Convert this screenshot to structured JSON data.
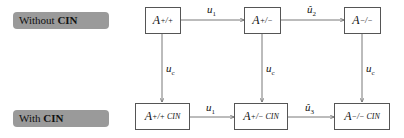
{
  "rows": [
    {
      "label_prefix": "Without ",
      "label_bold": "CIN"
    },
    {
      "label_prefix": "With ",
      "label_bold": "CIN"
    }
  ],
  "top_nodes": [
    {
      "base": "A",
      "sup": "+/+"
    },
    {
      "base": "A",
      "sup": "+/−"
    },
    {
      "base": "A",
      "sup": "−/−"
    }
  ],
  "bottom_nodes": [
    {
      "base": "A",
      "sup": "+/+ CIN"
    },
    {
      "base": "A",
      "sup": "+/− CIN"
    },
    {
      "base": "A",
      "sup": "−/− CIN"
    }
  ],
  "top_edges": [
    {
      "base": "u",
      "sub": "1"
    },
    {
      "base": "û",
      "sub": "2"
    }
  ],
  "bottom_edges": [
    {
      "base": "u",
      "sub": "1"
    },
    {
      "base": "û",
      "sub": "3"
    }
  ],
  "vertical_edges": [
    {
      "base": "u",
      "sub": "c"
    },
    {
      "base": "u",
      "sub": "c"
    },
    {
      "base": "u",
      "sub": "c"
    }
  ],
  "colors": {
    "label_bg": "#9a9a9a",
    "line": "#555555"
  }
}
